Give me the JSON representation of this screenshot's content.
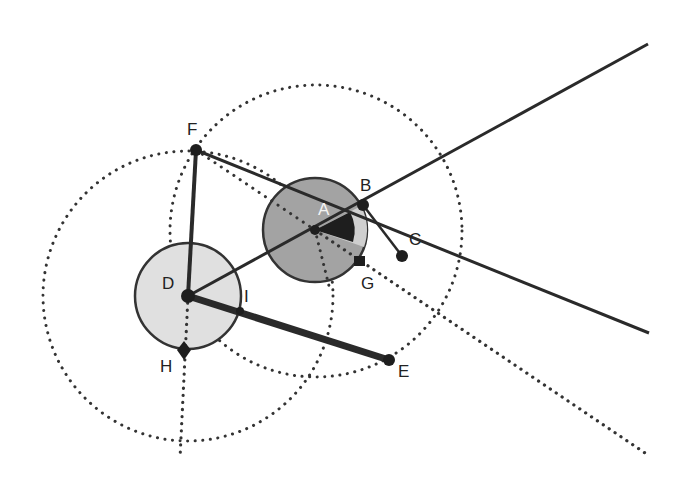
{
  "figure": {
    "colors": {
      "background": "#ffffff",
      "ink": "#2a2a2a",
      "circle_a_fill": "#9a9a9a",
      "circle_a_sector": "#c4c4c4",
      "circle_d_fill": "#dedede"
    }
  },
  "labels": {
    "A": "A",
    "B": "B",
    "C": "C",
    "D": "D",
    "E": "E",
    "F": "F",
    "G": "G",
    "H": "H",
    "I": "I"
  },
  "points": {
    "A": [
      315,
      230
    ],
    "B": [
      363,
      205
    ],
    "C": [
      402,
      256
    ],
    "D": [
      188,
      296
    ],
    "E": [
      389,
      360
    ],
    "F": [
      196,
      150
    ],
    "G": [
      360,
      262
    ],
    "H": [
      184,
      350
    ],
    "I": [
      240,
      311
    ]
  }
}
